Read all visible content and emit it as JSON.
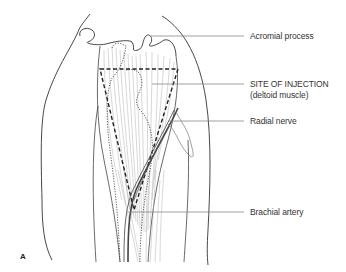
{
  "figure": {
    "panel_letter": "A",
    "labels": [
      {
        "id": "acromial",
        "text": "Acromial process"
      },
      {
        "id": "site",
        "text": "SITE OF INJECTION"
      },
      {
        "id": "site_sub",
        "text": "(deltoid muscle)"
      },
      {
        "id": "radial",
        "text": "Radial nerve"
      },
      {
        "id": "brachial",
        "text": "Brachial artery"
      }
    ],
    "colors": {
      "outline": "#333333",
      "leader": "#777777",
      "muscle_fibers": "#9a9a9a",
      "injection_border": "#222222",
      "vessel": "#444444"
    }
  }
}
